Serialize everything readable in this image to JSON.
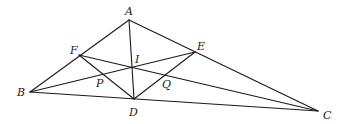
{
  "diagram": {
    "type": "geometry",
    "points": {
      "A": {
        "label": "A",
        "x": 129,
        "y": 20,
        "lx": 125,
        "ly": 15
      },
      "B": {
        "label": "B",
        "x": 30,
        "y": 92,
        "lx": 17,
        "ly": 96
      },
      "C": {
        "label": "C",
        "x": 318,
        "y": 111,
        "lx": 323,
        "ly": 119
      },
      "D": {
        "label": "D",
        "x": 134,
        "y": 99,
        "lx": 129,
        "ly": 116
      },
      "E": {
        "label": "E",
        "x": 195,
        "y": 52,
        "lx": 197,
        "ly": 50
      },
      "F": {
        "label": "F",
        "x": 79,
        "y": 55,
        "lx": 70,
        "ly": 54
      },
      "I": {
        "label": "I",
        "x": 133,
        "y": 68,
        "lx": 135,
        "ly": 63
      },
      "P": {
        "label": "P",
        "x": 102,
        "y": 74,
        "lx": 96,
        "ly": 87
      },
      "Q": {
        "label": "Q",
        "x": 165,
        "y": 76,
        "lx": 162,
        "ly": 88
      }
    },
    "segments": [
      [
        "A",
        "B"
      ],
      [
        "A",
        "C"
      ],
      [
        "B",
        "C"
      ],
      [
        "A",
        "D"
      ],
      [
        "B",
        "E"
      ],
      [
        "C",
        "F"
      ],
      [
        "F",
        "D"
      ],
      [
        "D",
        "E"
      ]
    ]
  }
}
